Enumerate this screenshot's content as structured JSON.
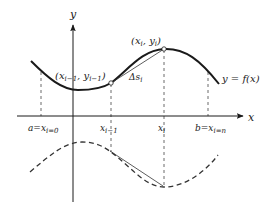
{
  "diagram": {
    "type": "arc-length-approximation",
    "axes": {
      "x_label": "x",
      "y_label": "y"
    },
    "curve_label": "y = f(x)",
    "points": {
      "prev": {
        "label_main": "(x",
        "sub1": "i−1",
        "mid": ", y",
        "sub2": "i−1",
        "close": ")"
      },
      "curr": {
        "label_main": "(x",
        "sub1": "i",
        "mid": ", y",
        "sub2": "i",
        "close": ")"
      }
    },
    "chord_label": {
      "main": "Δs",
      "sub": "i"
    },
    "ticks": [
      {
        "main": "a=x",
        "sub": "i=0"
      },
      {
        "main": "x",
        "sub": "i−1"
      },
      {
        "main": "x",
        "sub": "i"
      },
      {
        "main": "b=x",
        "sub": "i=n"
      }
    ],
    "colors": {
      "curve": "#1a1a1a",
      "axes": "#1a1a1a",
      "dashed": "#333333",
      "background": "#ffffff"
    }
  }
}
